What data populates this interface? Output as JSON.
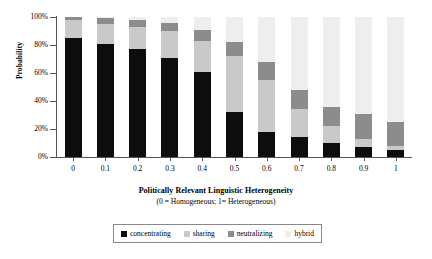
{
  "chart_data": {
    "type": "bar",
    "subtype": "stacked-100-percent",
    "title": "",
    "xlabel": "Politically Relevant Linguistic Heterogeneity",
    "xlabel_note": "(0 = Homogeneous; 1= Heterogeneous)",
    "ylabel": "Probability",
    "ylim": [
      0,
      100
    ],
    "yticks": [
      "0%",
      "20%",
      "40%",
      "60%",
      "80%",
      "100%"
    ],
    "ytick_values": [
      0,
      20,
      40,
      60,
      80,
      100
    ],
    "grid": false,
    "legend_position": "bottom",
    "categories": [
      "0",
      "0.1",
      "0.2",
      "0.3",
      "0.4",
      "0.5",
      "0.6",
      "0.7",
      "0.8",
      "0.9",
      "1"
    ],
    "category_values": [
      0,
      0.1,
      0.2,
      0.3,
      0.4,
      0.5,
      0.6,
      0.7,
      0.8,
      0.9,
      1
    ],
    "series": [
      {
        "name": "concentrating",
        "color": "#0d0d0d",
        "values": [
          85,
          81,
          77,
          71,
          61,
          32,
          18,
          14,
          10,
          7,
          5
        ]
      },
      {
        "name": "sharing",
        "color": "#c9c9c9",
        "values": [
          13,
          14,
          16,
          19,
          22,
          40,
          37,
          20,
          12,
          6,
          3
        ]
      },
      {
        "name": "neutralizing",
        "color": "#8c8c8c",
        "values": [
          2,
          4,
          5,
          6,
          8,
          10,
          13,
          14,
          14,
          18,
          17
        ]
      },
      {
        "name": "hybrid",
        "color": "#eeeeee",
        "values": [
          0,
          1,
          2,
          4,
          9,
          18,
          32,
          52,
          64,
          69,
          75
        ]
      }
    ]
  },
  "legend": {
    "items": [
      {
        "label": "concentrating"
      },
      {
        "label": "sharing"
      },
      {
        "label": "neutralizing"
      },
      {
        "label": "hybrid"
      }
    ]
  }
}
